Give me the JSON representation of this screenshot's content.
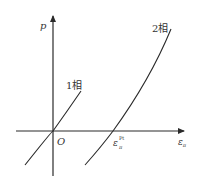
{
  "diagram": {
    "axes": {
      "y_label": "p",
      "x_label": "ε",
      "x_label_sub": "π",
      "origin_label": "O"
    },
    "curves": [
      {
        "name": "phase-1",
        "label": "1相"
      },
      {
        "name": "phase-2",
        "label": "2相"
      }
    ],
    "intercept": {
      "label": "ε",
      "sub": "π",
      "sup": "Pt"
    },
    "colors": {
      "line": "#2a2a2a",
      "text": "#333333",
      "background": "#ffffff"
    }
  }
}
